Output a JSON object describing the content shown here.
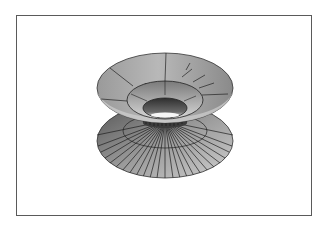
{
  "figure": {
    "caption": "",
    "frame_color": "#5a5a5a",
    "background_color": "#ffffff",
    "surface_colors": {
      "light": "#e6e6e6",
      "mid": "#a8a8a8",
      "dark": "#4a4a4a",
      "mesh": "#222222"
    },
    "top_flange": {
      "cx": 165,
      "cy": 88,
      "rx": 68,
      "ry": 35
    },
    "inner_rim": {
      "cx": 165,
      "cy": 100,
      "rx": 38,
      "ry": 19
    },
    "hole": {
      "cx": 165,
      "cy": 108,
      "rx": 22,
      "ry": 10
    },
    "waist": {
      "cx": 165,
      "cy": 121,
      "rx": 23,
      "ry": 5
    },
    "bottom_mid_ring": {
      "cx": 165,
      "cy": 131,
      "rx": 42,
      "ry": 17
    },
    "bottom_flange": {
      "cx": 165,
      "cy": 141,
      "rx": 68,
      "ry": 37
    }
  }
}
